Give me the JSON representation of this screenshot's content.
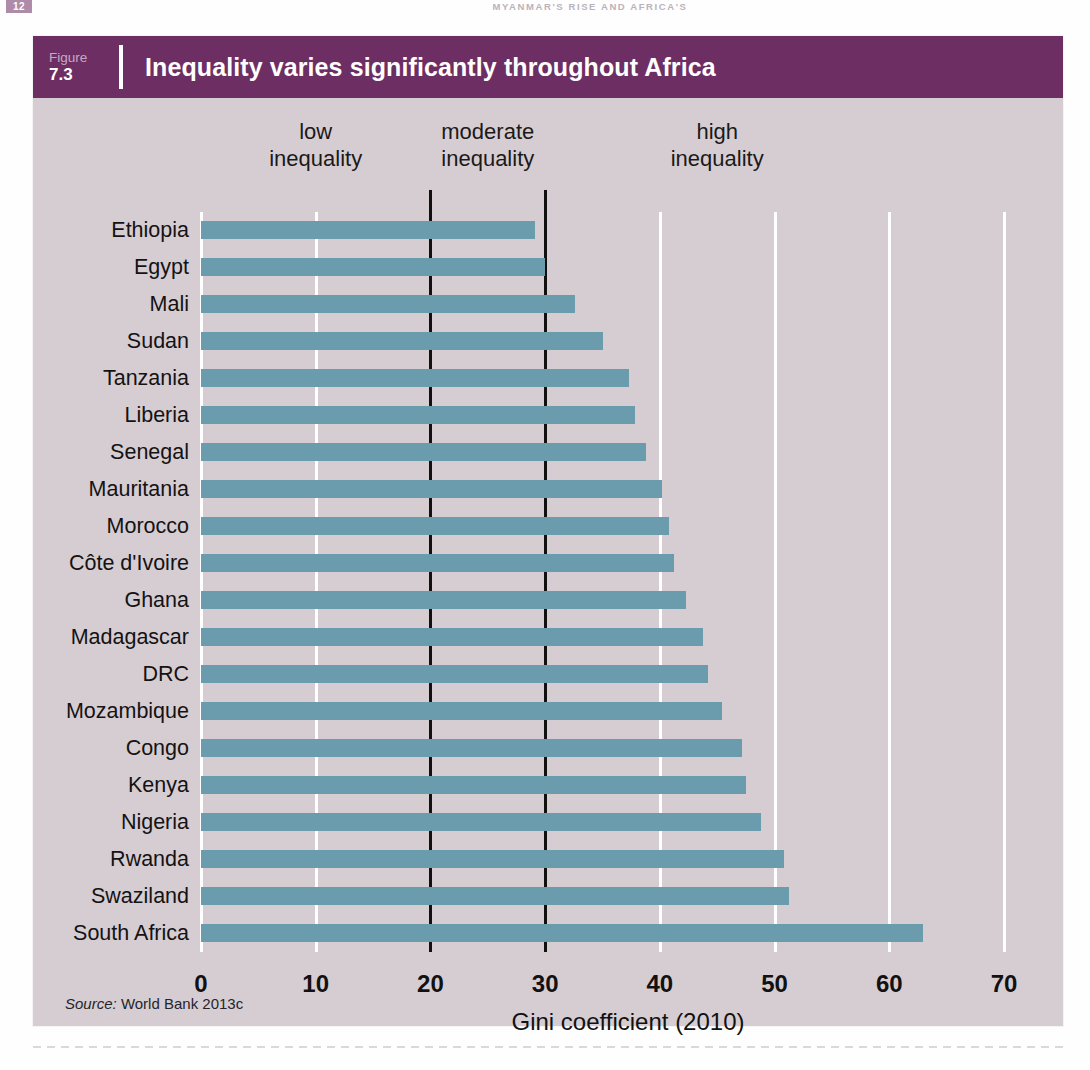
{
  "page": {
    "folio": "12",
    "running_title": "MYANMAR'S RISE AND AFRICA'S"
  },
  "figure": {
    "number_word": "Figure",
    "number": "7.3",
    "title": "Inequality varies significantly throughout Africa",
    "source_prefix": "Source:",
    "source_text": "World Bank 2013c"
  },
  "colors": {
    "header_purple": "#6d2f63",
    "panel_background": "#d6cdd3",
    "bar": "#6a9cad",
    "gridline": "#ffffff",
    "divider": "#12100f",
    "text": "#141312"
  },
  "annotations": [
    {
      "name": "low-inequality",
      "line1": "low",
      "line2": "inequality",
      "at_value": 10
    },
    {
      "name": "moderate-inequality",
      "line1": "moderate",
      "line2": "inequality",
      "at_value": 25
    },
    {
      "name": "high-inequality",
      "line1": "high",
      "line2": "inequality",
      "at_value": 45
    }
  ],
  "chart_data": {
    "type": "bar",
    "orientation": "horizontal",
    "title": "Inequality varies significantly throughout Africa",
    "xlabel": "Gini coefficient (2010)",
    "ylabel": "",
    "xlim": [
      0,
      70
    ],
    "xticks": [
      0,
      10,
      20,
      30,
      40,
      50,
      60,
      70
    ],
    "grid": true,
    "legend": "none",
    "dividers": [
      20,
      30
    ],
    "divider_note": "black vertical lines separating low / moderate / high inequality",
    "categories": [
      "Ethiopia",
      "Egypt",
      "Mali",
      "Sudan",
      "Tanzania",
      "Liberia",
      "Senegal",
      "Mauritania",
      "Morocco",
      "Côte d'Ivoire",
      "Ghana",
      "Madagascar",
      "DRC",
      "Mozambique",
      "Congo",
      "Kenya",
      "Nigeria",
      "Rwanda",
      "Swaziland",
      "South Africa"
    ],
    "values": [
      29.1,
      30.0,
      32.6,
      35.0,
      37.3,
      37.8,
      38.8,
      40.2,
      40.8,
      41.2,
      42.3,
      43.8,
      44.2,
      45.4,
      47.2,
      47.5,
      48.8,
      50.8,
      51.3,
      62.9
    ]
  }
}
